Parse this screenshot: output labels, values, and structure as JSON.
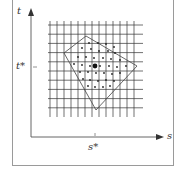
{
  "diagram": {
    "axes": {
      "x_label": "s",
      "y_label": "t",
      "x_tick_label": "s*",
      "y_tick_label": "t*"
    },
    "colors": {
      "frame": "#9a9a9a",
      "axis": "#555555",
      "grid": "#333333",
      "polygon": "#444444",
      "dots": "#222222",
      "text": "#333333"
    },
    "grid": {
      "vertical_lines": 13,
      "horizontal_lines": 10,
      "x_start": 50,
      "x_spacing": 7,
      "y_start": 25,
      "y_spacing": 9.2,
      "x_extent": [
        48,
        143
      ],
      "y_extent": [
        21,
        117
      ]
    },
    "polygon": {
      "vertices": [
        [
          86,
          36
        ],
        [
          137,
          66
        ],
        [
          96,
          110
        ],
        [
          64,
          53
        ]
      ]
    },
    "center_point": {
      "x": 95,
      "y": 66,
      "label_x": "s*",
      "label_y": "t*"
    },
    "sample_points": [
      [
        89,
        43
      ],
      [
        98,
        43
      ],
      [
        106,
        44
      ],
      [
        114,
        47
      ],
      [
        82,
        48
      ],
      [
        91,
        49
      ],
      [
        99,
        51
      ],
      [
        108,
        51
      ],
      [
        115,
        53
      ],
      [
        78,
        57
      ],
      [
        86,
        57
      ],
      [
        94,
        58
      ],
      [
        103,
        58
      ],
      [
        111,
        59
      ],
      [
        120,
        60
      ],
      [
        74,
        64
      ],
      [
        82,
        65
      ],
      [
        90,
        66
      ],
      [
        100,
        66
      ],
      [
        109,
        66
      ],
      [
        117,
        67
      ],
      [
        126,
        66
      ],
      [
        80,
        72
      ],
      [
        88,
        72
      ],
      [
        96,
        73
      ],
      [
        104,
        73
      ],
      [
        112,
        74
      ],
      [
        120,
        73
      ],
      [
        83,
        79
      ],
      [
        90,
        80
      ],
      [
        98,
        81
      ],
      [
        106,
        80
      ],
      [
        114,
        81
      ],
      [
        88,
        86
      ],
      [
        95,
        87
      ],
      [
        103,
        87
      ],
      [
        110,
        86
      ]
    ]
  }
}
